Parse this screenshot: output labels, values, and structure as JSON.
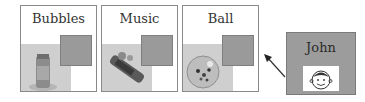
{
  "cards": [
    {
      "label": "Bubbles",
      "object": "bubbles-bottle"
    },
    {
      "label": "Music",
      "object": "music-toy"
    },
    {
      "label": "Ball",
      "object": "glitter-ball"
    }
  ],
  "target": {
    "label": "John",
    "image": "smiley-face-drawing"
  },
  "arrow": {
    "direction": "from John toward Ball"
  },
  "colors": {
    "swatch": "#9a9a9a",
    "target_bg": "#9c9c9c",
    "border": "#8a8a8a"
  }
}
